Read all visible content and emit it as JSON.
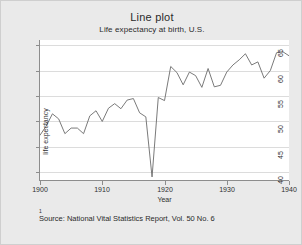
{
  "figure": {
    "background_color": "#eaeaea",
    "border_color": "#cfcfcf",
    "plot_background_color": "#ffffff",
    "axis_color": "#8d8d8d",
    "gridline_color": "#dcdcdc",
    "line_color": "#6b6b6b"
  },
  "footnote": {
    "marker": "1",
    "text": "Source:  National Vital Statistics Report, Vol. 50 No. 6"
  },
  "chart_data": {
    "type": "line",
    "title": "Line plot",
    "subtitle": "Life expectancy at birth, U.S.",
    "xlabel": "Year",
    "ylabel": "life expectancy",
    "xlim": [
      1900,
      1940
    ],
    "ylim": [
      38.5,
      66
    ],
    "xticks": [
      1900,
      1910,
      1920,
      1930,
      1940
    ],
    "xticklabels": [
      "1900",
      "1910",
      "1920",
      "1930",
      "1940"
    ],
    "yticks": [
      40,
      45,
      50,
      55,
      60,
      65
    ],
    "yticklabels": [
      "40",
      "45",
      "50",
      "55",
      "60",
      "65"
    ],
    "grid": "horizontal",
    "legend": "none",
    "x": [
      1900,
      1901,
      1902,
      1903,
      1904,
      1905,
      1906,
      1907,
      1908,
      1909,
      1910,
      1911,
      1912,
      1913,
      1914,
      1915,
      1916,
      1917,
      1918,
      1919,
      1920,
      1921,
      1922,
      1923,
      1924,
      1925,
      1926,
      1927,
      1928,
      1929,
      1930,
      1931,
      1932,
      1933,
      1934,
      1935,
      1936,
      1937,
      1938,
      1939,
      1940
    ],
    "values": [
      47.3,
      49.1,
      51.5,
      50.5,
      47.6,
      48.7,
      48.7,
      47.6,
      51.1,
      52.1,
      50.0,
      52.6,
      53.5,
      52.5,
      54.2,
      54.5,
      51.7,
      50.9,
      39.1,
      54.7,
      54.1,
      60.8,
      59.6,
      57.2,
      59.7,
      59.0,
      56.7,
      60.4,
      56.8,
      57.1,
      59.7,
      61.1,
      62.1,
      63.3,
      61.1,
      61.7,
      58.5,
      60.0,
      63.5,
      63.7,
      62.9
    ]
  }
}
